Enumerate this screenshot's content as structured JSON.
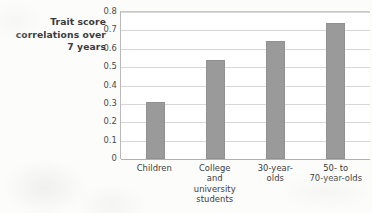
{
  "chart_data": {
    "type": "bar",
    "title": "",
    "xlabel": "",
    "ylabel": "Trait score correlations over 7 years",
    "ylabel_lines": [
      "Trait score",
      "correlations over",
      "7 years"
    ],
    "categories": [
      "Children",
      "College and university students",
      "30-year-olds",
      "50- to 70-year-olds"
    ],
    "category_lines": [
      [
        "Children"
      ],
      [
        "College",
        "and",
        "university",
        "students"
      ],
      [
        "30-year-",
        "olds"
      ],
      [
        "50- to",
        "70-year-olds"
      ]
    ],
    "values": [
      0.31,
      0.54,
      0.64,
      0.74
    ],
    "ylim": [
      0,
      0.8
    ],
    "ytick_labels": [
      "0.8",
      "0.7",
      "0.6",
      "0.5",
      "0.4",
      "0.3",
      "0.2",
      "0.1",
      "0"
    ],
    "ytick_values": [
      0.8,
      0.7,
      0.6,
      0.5,
      0.4,
      0.3,
      0.2,
      0.1,
      0
    ],
    "grid": true,
    "legend": "none",
    "bar_color": "#9a9a9a",
    "gridline_color": "#d7d7d7",
    "axis_color": "#b9b9b9",
    "plot_background": "#ffffff",
    "page_background": "#fcfcfb"
  }
}
